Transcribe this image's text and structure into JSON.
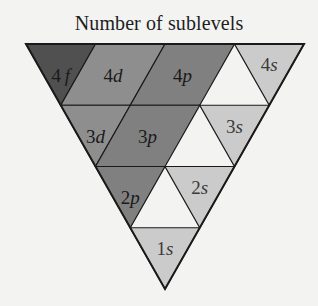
{
  "title": "Number of sublevels",
  "colors": {
    "f": "#505050",
    "d": "#8e8e8e",
    "p": "#808080",
    "s": "#cbcbcb",
    "stroke": "#1a1a1a",
    "background": "#f3f3f1"
  },
  "rows": [
    {
      "level": "4",
      "sublevels": [
        {
          "n": "4",
          "l": "f"
        },
        {
          "n": "4",
          "l": "d"
        },
        {
          "n": "4",
          "l": "p"
        },
        {
          "n": "4",
          "l": "s"
        }
      ]
    },
    {
      "level": "3",
      "sublevels": [
        {
          "n": "3",
          "l": "d"
        },
        {
          "n": "3",
          "l": "p"
        },
        {
          "n": "3",
          "l": "s"
        }
      ]
    },
    {
      "level": "2",
      "sublevels": [
        {
          "n": "2",
          "l": "p"
        },
        {
          "n": "2",
          "l": "s"
        }
      ]
    },
    {
      "level": "1",
      "sublevels": [
        {
          "n": "1",
          "l": "s"
        }
      ]
    }
  ]
}
